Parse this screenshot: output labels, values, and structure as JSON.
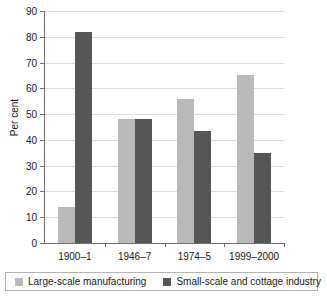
{
  "chart_data": {
    "type": "bar",
    "title": "",
    "subtitle": "",
    "xlabel": "",
    "ylabel": "Per cent",
    "categories": [
      "1900–1",
      "1946–7",
      "1974–5",
      "1999–2000"
    ],
    "series": [
      {
        "name": "Large-scale manufacturing",
        "color": "#b9b9b9",
        "values": [
          14,
          48,
          56,
          65
        ]
      },
      {
        "name": "Small-scale and cottage industry",
        "color": "#565656",
        "values": [
          82,
          48,
          43.5,
          35
        ]
      }
    ],
    "ylim": [
      0,
      90
    ],
    "ytick_step": 10,
    "yticks": [
      0,
      10,
      20,
      30,
      40,
      50,
      60,
      70,
      80,
      90
    ],
    "ytick_labels": [
      "0",
      "10",
      "20",
      "30",
      "40",
      "50",
      "60",
      "70",
      "80",
      "90"
    ],
    "grid": "horizontal",
    "legend_position": "bottom",
    "axis_color": "#6f6f6f",
    "grid_color": "#dcdcdc",
    "background": "#ffffff"
  },
  "legend": {
    "entries": [
      {
        "label": "Large-scale manufacturing",
        "swatch": "light-swatch"
      },
      {
        "label": "Small-scale and cottage industry",
        "swatch": "dark-swatch"
      }
    ]
  }
}
